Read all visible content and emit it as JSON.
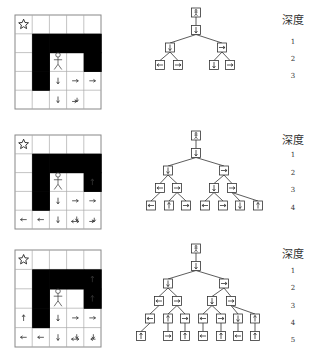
{
  "depth_header": "深度",
  "panels": [
    {
      "depth_labels": [
        "1",
        "2",
        "3"
      ],
      "grid": {
        "walls": [
          [
            1,
            1
          ],
          [
            1,
            2
          ],
          [
            1,
            3
          ],
          [
            1,
            4
          ],
          [
            2,
            1
          ],
          [
            2,
            4
          ],
          [
            3,
            1
          ]
        ],
        "goal": [
          0,
          0
        ],
        "agent": [
          2,
          2
        ],
        "arrows": [
          {
            "r": 3,
            "c": 2,
            "dir": "down"
          },
          {
            "r": 4,
            "c": 2,
            "dir": "down"
          },
          {
            "r": 3,
            "c": 3,
            "dir": "right"
          },
          {
            "r": 3,
            "c": 4,
            "dir": "right"
          },
          {
            "r": 4,
            "c": 3,
            "dir": "right-down"
          }
        ]
      },
      "tree": {
        "levels": 4,
        "nodes": [
          {
            "id": "r",
            "level": 0,
            "x": 196,
            "sym": "agent"
          },
          {
            "id": "a",
            "level": 1,
            "x": 196,
            "sym": "down",
            "parent": "r"
          },
          {
            "id": "b",
            "level": 2,
            "x": 170,
            "sym": "down",
            "parent": "a"
          },
          {
            "id": "c",
            "level": 2,
            "x": 222,
            "sym": "right",
            "parent": "a"
          },
          {
            "id": "d",
            "level": 3,
            "x": 160,
            "sym": "left",
            "parent": "b"
          },
          {
            "id": "e",
            "level": 3,
            "x": 178,
            "sym": "right",
            "parent": "b"
          },
          {
            "id": "f",
            "level": 3,
            "x": 214,
            "sym": "down",
            "parent": "c"
          },
          {
            "id": "g",
            "level": 3,
            "x": 230,
            "sym": "right",
            "parent": "c"
          }
        ]
      }
    },
    {
      "depth_labels": [
        "1",
        "2",
        "3",
        "4"
      ],
      "grid": {
        "walls": [
          [
            1,
            1
          ],
          [
            1,
            2
          ],
          [
            1,
            3
          ],
          [
            1,
            4
          ],
          [
            2,
            1
          ],
          [
            2,
            4
          ],
          [
            3,
            1
          ]
        ],
        "goal": [
          0,
          0
        ],
        "agent": [
          2,
          2
        ],
        "arrows": [
          {
            "r": 3,
            "c": 2,
            "dir": "down"
          },
          {
            "r": 4,
            "c": 2,
            "dir": "down"
          },
          {
            "r": 3,
            "c": 3,
            "dir": "right"
          },
          {
            "r": 3,
            "c": 4,
            "dir": "right"
          },
          {
            "r": 2,
            "c": 4,
            "dir": "up"
          },
          {
            "r": 4,
            "c": 0,
            "dir": "left"
          },
          {
            "r": 4,
            "c": 1,
            "dir": "left"
          },
          {
            "r": 4,
            "c": 3,
            "dir": "left-right"
          },
          {
            "r": 4,
            "c": 4,
            "dir": "right-down"
          }
        ]
      },
      "tree": {
        "levels": 5,
        "nodes": [
          {
            "id": "r",
            "level": 0,
            "x": 196,
            "sym": "agent"
          },
          {
            "id": "a",
            "level": 1,
            "x": 196,
            "sym": "down",
            "parent": "r"
          },
          {
            "id": "b",
            "level": 2,
            "x": 168,
            "sym": "down",
            "parent": "a"
          },
          {
            "id": "c",
            "level": 2,
            "x": 224,
            "sym": "right",
            "parent": "a"
          },
          {
            "id": "d",
            "level": 3,
            "x": 160,
            "sym": "left",
            "parent": "b"
          },
          {
            "id": "e",
            "level": 3,
            "x": 177,
            "sym": "right",
            "parent": "b"
          },
          {
            "id": "f",
            "level": 3,
            "x": 214,
            "sym": "down",
            "parent": "c"
          },
          {
            "id": "g",
            "level": 3,
            "x": 232,
            "sym": "right",
            "parent": "c"
          },
          {
            "id": "h",
            "level": 4,
            "x": 151,
            "sym": "left",
            "parent": "d"
          },
          {
            "id": "i",
            "level": 4,
            "x": 169,
            "sym": "up",
            "parent": "e"
          },
          {
            "id": "j",
            "level": 4,
            "x": 186,
            "sym": "right",
            "parent": "e"
          },
          {
            "id": "k",
            "level": 4,
            "x": 205,
            "sym": "left",
            "parent": "f"
          },
          {
            "id": "l",
            "level": 4,
            "x": 223,
            "sym": "right",
            "parent": "f"
          },
          {
            "id": "m",
            "level": 4,
            "x": 240,
            "sym": "down",
            "parent": "g"
          },
          {
            "id": "n",
            "level": 4,
            "x": 258,
            "sym": "up",
            "parent": "g"
          }
        ]
      }
    },
    {
      "depth_labels": [
        "1",
        "2",
        "3",
        "4",
        "5"
      ],
      "grid": {
        "walls": [
          [
            1,
            1
          ],
          [
            1,
            2
          ],
          [
            1,
            3
          ],
          [
            1,
            4
          ],
          [
            2,
            1
          ],
          [
            2,
            4
          ],
          [
            3,
            1
          ]
        ],
        "goal": [
          0,
          0
        ],
        "agent": [
          2,
          2
        ],
        "arrows": [
          {
            "r": 3,
            "c": 2,
            "dir": "down"
          },
          {
            "r": 4,
            "c": 2,
            "dir": "down"
          },
          {
            "r": 3,
            "c": 3,
            "dir": "right"
          },
          {
            "r": 3,
            "c": 4,
            "dir": "right"
          },
          {
            "r": 1,
            "c": 4,
            "dir": "up"
          },
          {
            "r": 2,
            "c": 4,
            "dir": "up"
          },
          {
            "r": 3,
            "c": 0,
            "dir": "up"
          },
          {
            "r": 4,
            "c": 0,
            "dir": "left"
          },
          {
            "r": 4,
            "c": 1,
            "dir": "left"
          },
          {
            "r": 4,
            "c": 3,
            "dir": "left-right"
          },
          {
            "r": 4,
            "c": 4,
            "dir": "left-down"
          }
        ]
      },
      "tree": {
        "levels": 6,
        "nodes": [
          {
            "id": "r",
            "level": 0,
            "x": 196,
            "sym": "agent"
          },
          {
            "id": "a",
            "level": 1,
            "x": 196,
            "sym": "down",
            "parent": "r"
          },
          {
            "id": "b",
            "level": 2,
            "x": 168,
            "sym": "down",
            "parent": "a"
          },
          {
            "id": "c",
            "level": 2,
            "x": 224,
            "sym": "right",
            "parent": "a"
          },
          {
            "id": "d",
            "level": 3,
            "x": 159,
            "sym": "left",
            "parent": "b"
          },
          {
            "id": "e",
            "level": 3,
            "x": 177,
            "sym": "right",
            "parent": "b"
          },
          {
            "id": "f",
            "level": 3,
            "x": 212,
            "sym": "down",
            "parent": "c"
          },
          {
            "id": "g",
            "level": 3,
            "x": 231,
            "sym": "right",
            "parent": "c"
          },
          {
            "id": "h",
            "level": 4,
            "x": 150,
            "sym": "left",
            "parent": "d"
          },
          {
            "id": "i",
            "level": 4,
            "x": 168,
            "sym": "up",
            "parent": "e"
          },
          {
            "id": "j",
            "level": 4,
            "x": 185,
            "sym": "right",
            "parent": "e"
          },
          {
            "id": "k",
            "level": 4,
            "x": 203,
            "sym": "left",
            "parent": "f"
          },
          {
            "id": "l",
            "level": 4,
            "x": 221,
            "sym": "right",
            "parent": "f"
          },
          {
            "id": "m",
            "level": 4,
            "x": 238,
            "sym": "down",
            "parent": "g"
          },
          {
            "id": "n",
            "level": 4,
            "x": 255,
            "sym": "up",
            "parent": "g"
          },
          {
            "id": "o",
            "level": 5,
            "x": 141,
            "sym": "up",
            "parent": "h"
          },
          {
            "id": "p",
            "level": 5,
            "x": 168,
            "sym": "right",
            "parent": "i"
          },
          {
            "id": "q",
            "level": 5,
            "x": 185,
            "sym": "up",
            "parent": "j"
          },
          {
            "id": "s",
            "level": 5,
            "x": 203,
            "sym": "left",
            "parent": "k"
          },
          {
            "id": "t",
            "level": 5,
            "x": 221,
            "sym": "up",
            "parent": "l"
          },
          {
            "id": "u",
            "level": 5,
            "x": 238,
            "sym": "left",
            "parent": "m"
          },
          {
            "id": "v",
            "level": 5,
            "x": 255,
            "sym": "up",
            "parent": "n"
          }
        ]
      }
    }
  ]
}
